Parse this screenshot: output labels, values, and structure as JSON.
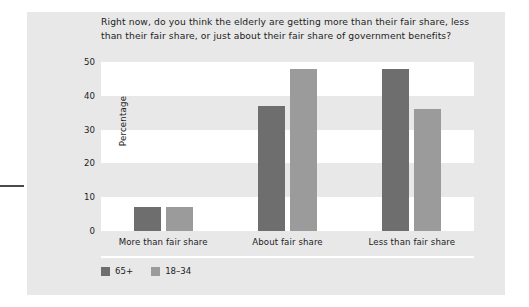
{
  "chart_data": {
    "type": "bar",
    "title": "Right now, do you think the elderly are getting more than their fair share, less than their fair share, or just about their fair share of government benefits?",
    "xlabel": "",
    "ylabel": "Percentage",
    "categories": [
      "More than fair share",
      "About fair share",
      "Less than fair share"
    ],
    "series": [
      {
        "name": "65+",
        "color": "#6e6e6e",
        "values": [
          7,
          37,
          48
        ]
      },
      {
        "name": "18–34",
        "color": "#9b9b9b",
        "values": [
          7,
          48,
          36
        ]
      }
    ],
    "ylim": [
      0,
      50
    ],
    "yticks": [
      0,
      10,
      20,
      30,
      40,
      50
    ],
    "ytick_labels": [
      "0",
      "10",
      "20",
      "30",
      "40",
      "50"
    ],
    "grid": "alternating-horizontal-bands",
    "legend_position": "bottom-left",
    "background_color": "#e8e8e8",
    "band_color": "#ffffff"
  }
}
